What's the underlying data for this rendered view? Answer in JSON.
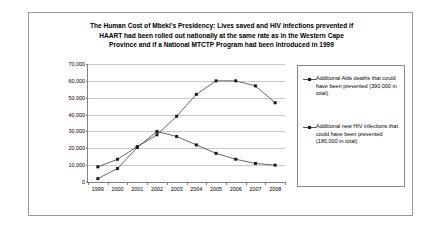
{
  "chart_data": {
    "type": "line",
    "title_lines": [
      "The Human Cost of Mbeki's Presidency: Lives saved and HIV infections prevented if",
      "HAART had been rolled out nationally at the same rate as in the Western Cape",
      "Province and if a National MTCTP Program had been Introduced in 1999"
    ],
    "xlabel": "",
    "ylabel": "",
    "categories": [
      "1999",
      "2000",
      "2001",
      "2002",
      "2003",
      "2004",
      "2005",
      "2006",
      "2007",
      "2008"
    ],
    "x": [
      1999,
      2000,
      2001,
      2002,
      2003,
      2004,
      2005,
      2006,
      2007,
      2008
    ],
    "ylim": [
      0,
      70000
    ],
    "ytick_values": [
      0,
      10000,
      20000,
      30000,
      40000,
      50000,
      60000,
      70000
    ],
    "ytick_labels": [
      "0",
      "10,000",
      "20,000",
      "30,000",
      "40,000",
      "50,000",
      "60,000",
      "70,000"
    ],
    "grid": true,
    "legend_position": "right",
    "series": [
      {
        "name": "Additional Aids deaths that could have been prevented (390,000 in total)",
        "total": "390,000 in total",
        "marker": "square",
        "color": "#404040",
        "values": [
          9000,
          13500,
          21000,
          28000,
          39000,
          52000,
          60000,
          60000,
          57000,
          47000
        ]
      },
      {
        "name": "Additional new HIV infections that could have been prevented (180,000 in total)",
        "total": "180,000 in total",
        "marker": "square",
        "color": "#404040",
        "values": [
          2000,
          8000,
          20500,
          30000,
          27000,
          22000,
          17000,
          13500,
          11000,
          10000
        ]
      }
    ]
  },
  "legend": {
    "entries": [
      {
        "line1": "Additional Aids deaths that",
        "line2": "could have been prevented",
        "line3": "(390,000 in total)"
      },
      {
        "line1": "Additional new HIV",
        "line2": "infections that could have",
        "line3": "been prevented (180,000 in",
        "line4": "total)"
      }
    ]
  }
}
